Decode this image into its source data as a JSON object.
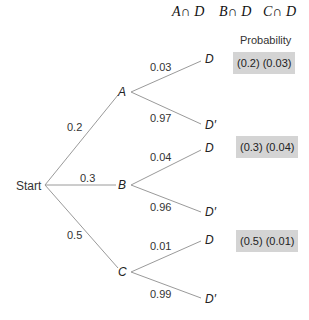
{
  "header": {
    "events": [
      "A∩ D",
      "B∩ D",
      "C∩ D"
    ],
    "probability_label": "Probability"
  },
  "tree": {
    "root_label": "Start",
    "branches": [
      {
        "node": "A",
        "prob": "0.2",
        "outcomes": [
          {
            "label": "D",
            "prob": "0.03"
          },
          {
            "label": "D′",
            "prob": "0.97"
          }
        ],
        "result": "(0.2) (0.03)"
      },
      {
        "node": "B",
        "prob": "0.3",
        "outcomes": [
          {
            "label": "D",
            "prob": "0.04"
          },
          {
            "label": "D′",
            "prob": "0.96"
          }
        ],
        "result": "(0.3) (0.04)"
      },
      {
        "node": "C",
        "prob": "0.5",
        "outcomes": [
          {
            "label": "D",
            "prob": "0.01"
          },
          {
            "label": "D′",
            "prob": "0.99"
          }
        ],
        "result": "(0.5) (0.01)"
      }
    ]
  },
  "colors": {
    "line": "#9a9a9a",
    "box": "#d4d4d4"
  }
}
